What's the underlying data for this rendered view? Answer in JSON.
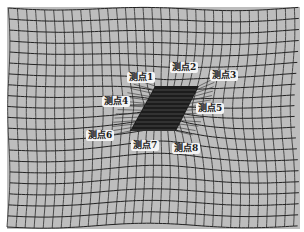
{
  "figure": {
    "mesh": {
      "background_color": "#bdbdbd",
      "line_color": "#2a2a2a",
      "trench_color": "#1c1c1c"
    },
    "labels": [
      {
        "id": 1,
        "text": "测点1",
        "x": 127,
        "y": 72
      },
      {
        "id": 2,
        "text": "测点2",
        "x": 170,
        "y": 62
      },
      {
        "id": 3,
        "text": "测点3",
        "x": 210,
        "y": 70
      },
      {
        "id": 4,
        "text": "测点4",
        "x": 102,
        "y": 96
      },
      {
        "id": 5,
        "text": "测点5",
        "x": 196,
        "y": 103
      },
      {
        "id": 6,
        "text": "测点6",
        "x": 86,
        "y": 130
      },
      {
        "id": 7,
        "text": "测点7",
        "x": 131,
        "y": 140
      },
      {
        "id": 8,
        "text": "测点8",
        "x": 172,
        "y": 143
      }
    ]
  }
}
